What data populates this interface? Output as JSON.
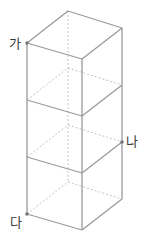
{
  "diagram": {
    "title": "",
    "colors": {
      "edge": "#9a9a9a",
      "hidden_edge": "#bdbdbd",
      "point": "#777777",
      "label": "#3a3a3a"
    },
    "labels": {
      "ga": "가",
      "na": "나",
      "da": "다"
    },
    "cube_count": 3
  }
}
